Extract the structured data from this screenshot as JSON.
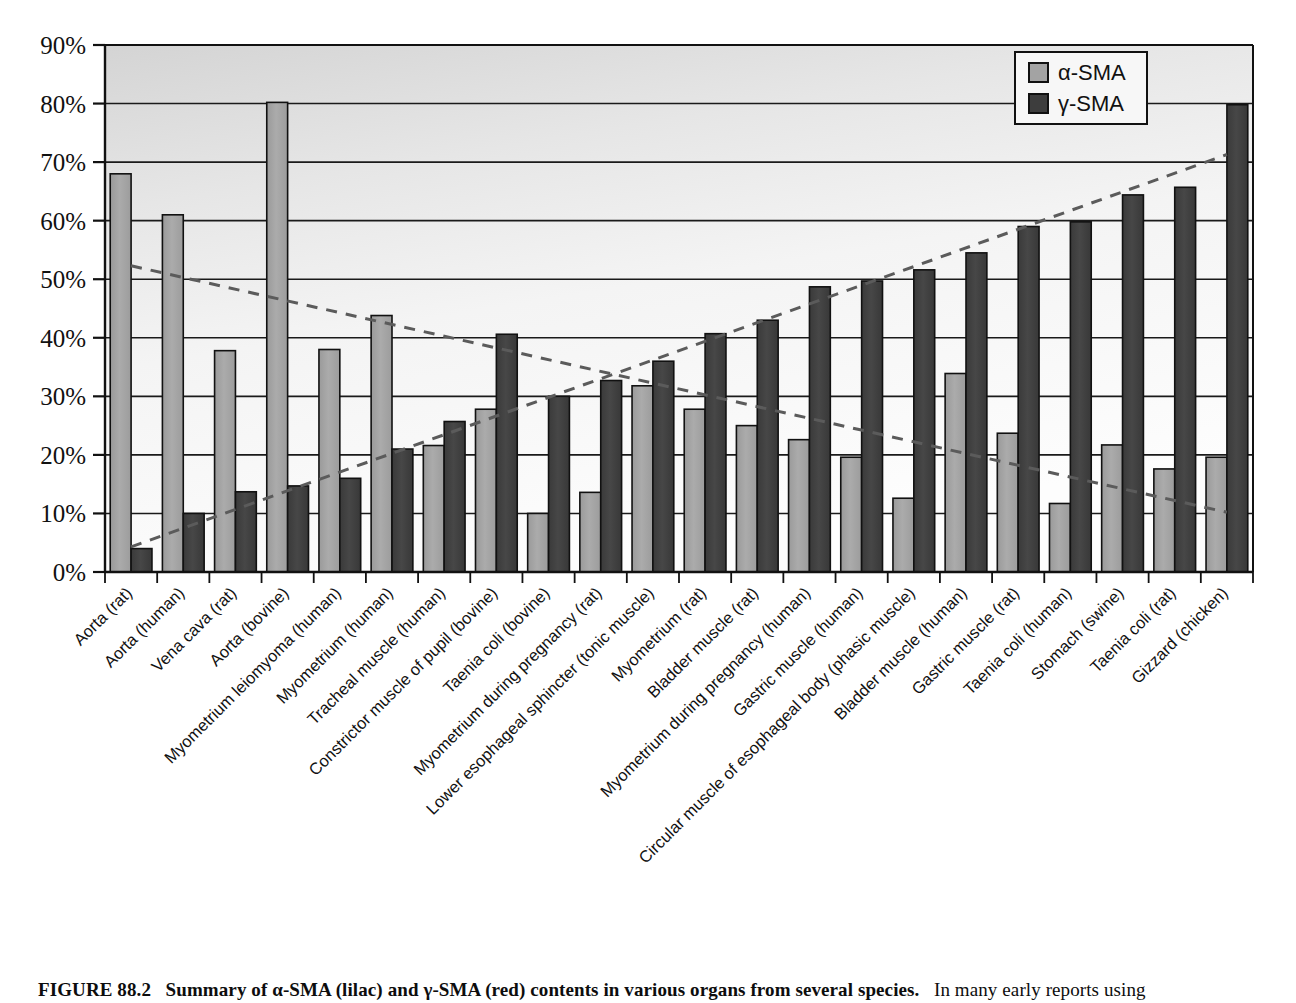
{
  "figure": {
    "number": "FIGURE 88.2",
    "caption_bold": "Summary of α-SMA (lilac) and γ-SMA (red) contents in various organs from several species.",
    "caption_rest": "In many early reports using"
  },
  "legend": {
    "position": "top-right",
    "entries": [
      {
        "label": "α-SMA",
        "color": "#a3a3a3",
        "swatch_name": "alpha-sma-swatch"
      },
      {
        "label": "γ-SMA",
        "color": "#3d3d3d",
        "swatch_name": "gamma-sma-swatch"
      }
    ]
  },
  "colors": {
    "alpha_sma": "#a3a3a3",
    "gamma_sma": "#3d3d3d",
    "bar_stroke": "#111111",
    "gridline": "#1a1a1a",
    "axis": "#111111",
    "trend_alpha": "#5b5b5b",
    "trend_gamma": "#5b5b5b",
    "plot_bg_light": "#fbfbfb",
    "plot_bg_shade": "#d9d9d9"
  },
  "chart_data": {
    "type": "bar",
    "title": "",
    "subtitle": "",
    "xlabel": "",
    "ylabel": "",
    "ylim": [
      0,
      90
    ],
    "ytick_step": 10,
    "ytick_labels": [
      "0%",
      "10%",
      "20%",
      "30%",
      "40%",
      "50%",
      "60%",
      "70%",
      "80%",
      "90%"
    ],
    "grid": true,
    "legend_position": "top-right",
    "categories": [
      "Aorta (rat)",
      "Aorta (human)",
      "Vena cava (rat)",
      "Aorta (bovine)",
      "Myometrium leiomyoma (human)",
      "Myometrium (human)",
      "Tracheal muscle (human)",
      "Constrictor muscle of pupil (bovine)",
      "Taenia coli (bovine)",
      "Myometrium during pregnancy (rat)",
      "Lower esophageal sphincter (tonic muscle)",
      "Myometrium (rat)",
      "Bladder muscle (rat)",
      "Myometrium during pregnancy (human)",
      "Gastric muscle (human)",
      "Circular muscle of esophageal body (phasic muscle)",
      "Bladder muscle (human)",
      "Gastric muscle (rat)",
      "Taenia coli (human)",
      "Stomach (swine)",
      "Taenia coli (rat)",
      "Gizzard (chicken)"
    ],
    "series": [
      {
        "name": "α-SMA",
        "color": "#a3a3a3",
        "values": [
          68.0,
          61.0,
          37.8,
          80.2,
          38.0,
          43.8,
          21.6,
          27.8,
          10.0,
          13.6,
          31.8,
          27.8,
          25.0,
          22.6,
          19.6,
          12.6,
          33.9,
          23.7,
          11.7,
          21.7,
          17.6,
          19.6
        ]
      },
      {
        "name": "γ-SMA",
        "color": "#3d3d3d",
        "values": [
          4.0,
          10.0,
          13.7,
          14.7,
          16.0,
          21.0,
          25.7,
          40.6,
          30.0,
          32.7,
          36.0,
          40.7,
          43.0,
          48.7,
          49.7,
          51.6,
          54.5,
          59.0,
          59.8,
          64.4,
          65.7,
          79.8
        ]
      }
    ],
    "trendlines": [
      {
        "name": "α-SMA trend",
        "style": "dashed",
        "from": [
          0.5,
          52.3
        ],
        "to": [
          21.5,
          10.2
        ]
      },
      {
        "name": "γ-SMA trend",
        "style": "dashed",
        "from": [
          0.5,
          4.3
        ],
        "to": [
          21.5,
          71.3
        ]
      }
    ]
  }
}
